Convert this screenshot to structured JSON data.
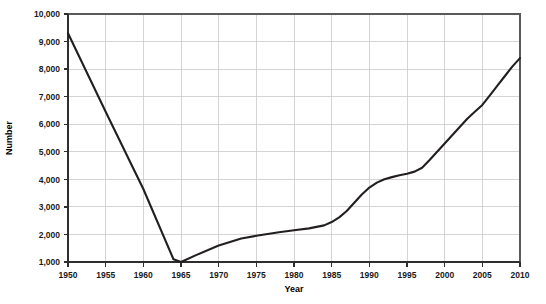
{
  "chart_data": {
    "type": "line",
    "title": "",
    "xlabel": "Year",
    "ylabel": "Number",
    "xlim": [
      1950,
      2010
    ],
    "ylim": [
      1000,
      10000
    ],
    "grid": true,
    "legend": "none",
    "x_tick_labels": [
      "1950",
      "1955",
      "1960",
      "1965",
      "1970",
      "1975",
      "1980",
      "1985",
      "1990",
      "1995",
      "2000",
      "2005",
      "2010"
    ],
    "x_ticks": [
      1950,
      1955,
      1960,
      1965,
      1970,
      1975,
      1980,
      1985,
      1990,
      1995,
      2000,
      2005,
      2010
    ],
    "y_tick_labels": [
      "1,000",
      "2,000",
      "3,000",
      "4,000",
      "5,000",
      "6,000",
      "7,000",
      "8,000",
      "9,000",
      "10,000"
    ],
    "y_ticks": [
      1000,
      2000,
      3000,
      4000,
      5000,
      6000,
      7000,
      8000,
      9000,
      10000
    ],
    "line_color": "#231f20",
    "grid_color": "#c9c9c9",
    "series": [
      {
        "name": "Number",
        "x": [
          1950,
          1955,
          1960,
          1964,
          1965,
          1967,
          1970,
          1973,
          1975,
          1978,
          1980,
          1982,
          1984,
          1985,
          1986,
          1987,
          1988,
          1989,
          1990,
          1991,
          1992,
          1993,
          1994,
          1995,
          1996,
          1997,
          1998,
          1999,
          2000,
          2001,
          2002,
          2003,
          2004,
          2005,
          2006,
          2007,
          2008,
          2009,
          2010
        ],
        "values": [
          9300,
          6450,
          3650,
          1100,
          1000,
          1250,
          1600,
          1850,
          1950,
          2080,
          2150,
          2220,
          2330,
          2450,
          2620,
          2850,
          3150,
          3450,
          3700,
          3880,
          4000,
          4080,
          4150,
          4200,
          4280,
          4420,
          4700,
          5000,
          5300,
          5600,
          5900,
          6200,
          6450,
          6700,
          7050,
          7400,
          7750,
          8100,
          8400
        ]
      }
    ]
  }
}
